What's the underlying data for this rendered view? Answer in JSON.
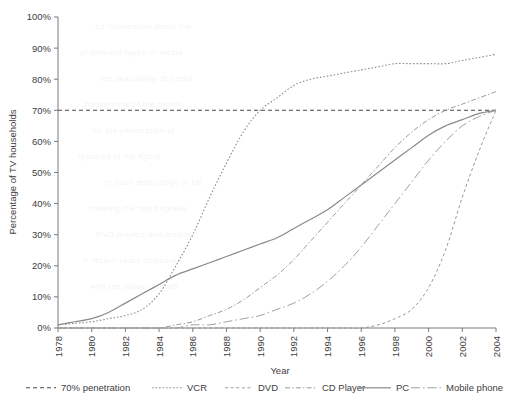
{
  "chart_data": {
    "type": "line",
    "title": "",
    "xlabel": "Year",
    "ylabel": "Percentage of TV households",
    "xlim": [
      1978,
      2004
    ],
    "ylim": [
      0,
      100
    ],
    "grid": false,
    "legend_position": "bottom",
    "x_ticks": [
      "1978",
      "1980",
      "1982",
      "1984",
      "1986",
      "1988",
      "1990",
      "1992",
      "1994",
      "1996",
      "1998",
      "2000",
      "2002",
      "2004"
    ],
    "y_ticks": [
      "0%",
      "10%",
      "20%",
      "30%",
      "40%",
      "50%",
      "60%",
      "70%",
      "80%",
      "90%",
      "100%"
    ],
    "x": [
      1978,
      1979,
      1980,
      1981,
      1982,
      1983,
      1984,
      1985,
      1986,
      1987,
      1988,
      1989,
      1990,
      1991,
      1992,
      1993,
      1994,
      1995,
      1996,
      1997,
      1998,
      1999,
      2000,
      2001,
      2002,
      2003,
      2004
    ],
    "series": [
      {
        "name": "70% penetration",
        "style": "dashed",
        "color": "#4a4a4a",
        "values": [
          70,
          70,
          70,
          70,
          70,
          70,
          70,
          70,
          70,
          70,
          70,
          70,
          70,
          70,
          70,
          70,
          70,
          70,
          70,
          70,
          70,
          70,
          70,
          70,
          70,
          70,
          70
        ]
      },
      {
        "name": "VCR",
        "style": "dotted",
        "color": "#8e8e8e",
        "values": [
          1,
          1.5,
          2,
          3,
          4,
          6,
          11,
          20,
          30,
          42,
          53,
          63,
          70,
          74,
          78,
          80,
          81,
          82,
          83,
          84,
          85,
          85,
          85,
          85,
          86,
          87,
          88
        ]
      },
      {
        "name": "DVD",
        "style": "dashed-fine",
        "color": "#9a9a9a",
        "values": [
          0,
          0,
          0,
          0,
          0,
          0,
          0,
          0,
          0,
          0,
          0,
          0,
          0,
          0,
          0,
          0,
          0,
          0,
          0,
          1,
          3,
          6,
          13,
          25,
          42,
          57,
          70
        ]
      },
      {
        "name": "CD Player",
        "style": "dash-dot",
        "color": "#9a9a9a",
        "values": [
          0,
          0,
          0,
          0,
          0,
          0,
          0,
          1,
          2,
          4,
          6,
          9,
          13,
          17,
          22,
          28,
          34,
          40,
          46,
          52,
          58,
          63,
          67,
          70,
          72,
          74,
          76
        ]
      },
      {
        "name": "PC",
        "style": "solid",
        "color": "#8a8a8a",
        "values": [
          1,
          2,
          3,
          5,
          8,
          11,
          14,
          17,
          19,
          21,
          23,
          25,
          27,
          29,
          32,
          35,
          38,
          42,
          46,
          50,
          54,
          58,
          62,
          65,
          67,
          69,
          70
        ]
      },
      {
        "name": "Mobile phone",
        "style": "long-dash-dot",
        "color": "#a0a0a0",
        "values": [
          0,
          0,
          0,
          0,
          0,
          0,
          0,
          0,
          1,
          1,
          2,
          3,
          4,
          6,
          8,
          11,
          15,
          20,
          26,
          33,
          40,
          47,
          54,
          60,
          65,
          68,
          70
        ]
      }
    ]
  },
  "legend": {
    "items": [
      {
        "label": "70% penetration"
      },
      {
        "label": "VCR"
      },
      {
        "label": "DVD"
      },
      {
        "label": "CD Player"
      },
      {
        "label": "PC"
      },
      {
        "label": "Mobile phone"
      }
    ]
  },
  "watermark_text": {
    "lines": [
      "ed information about the",
      "of different types of media",
      "the availability of media",
      "households of the report",
      "for the penetration of",
      "reported in the figure",
      "of such technology in UK",
      "showing the rapid uptake",
      "DVD players and mobile",
      "in recent years compared",
      "with the slower growth"
    ]
  }
}
